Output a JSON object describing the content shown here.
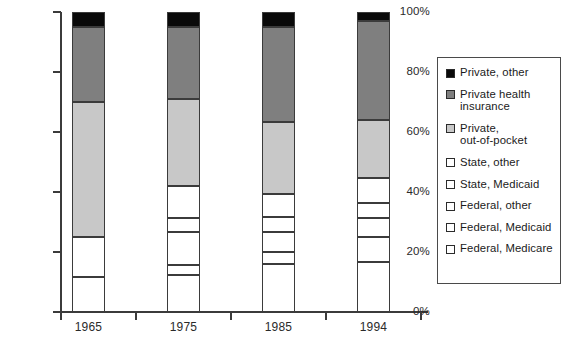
{
  "chart_data": {
    "type": "bar",
    "subtype": "stacked-percentage",
    "title": "",
    "xlabel": "",
    "ylabel": "",
    "categories": [
      "1965",
      "1975",
      "1985",
      "1994"
    ],
    "ylim": [
      0,
      100
    ],
    "ytick_labels": [
      "0%",
      "20%",
      "40%",
      "60%",
      "80%",
      "100%"
    ],
    "ytick_values": [
      0,
      20,
      40,
      60,
      80,
      100
    ],
    "grid": false,
    "legend_position": "right",
    "stack_order_bottom_to_top": [
      "Federal, Medicare",
      "Federal, Medicaid",
      "Federal, other",
      "State, Medicaid",
      "State, other",
      "Private, out-of-pocket",
      "Private health insurance",
      "Private, other"
    ],
    "series": [
      {
        "name": "Federal, Medicare",
        "color": "#ffffff",
        "values": [
          11.7,
          12.3,
          16.0,
          16.7
        ]
      },
      {
        "name": "Federal, Medicaid",
        "color": "#ffffff",
        "values": [
          0.0,
          3.4,
          4.0,
          8.3
        ]
      },
      {
        "name": "Federal, other",
        "color": "#ffffff",
        "values": [
          13.3,
          11.0,
          6.7,
          6.3
        ]
      },
      {
        "name": "State, Medicaid",
        "color": "#ffffff",
        "values": [
          0.0,
          4.6,
          5.0,
          5.0
        ]
      },
      {
        "name": "State, other",
        "color": "#ffffff",
        "values": [
          0.0,
          10.7,
          7.7,
          8.4
        ]
      },
      {
        "name": "Private, out-of-pocket",
        "color": "#c8c8c8",
        "values": [
          45.0,
          29.0,
          24.1,
          19.3
        ]
      },
      {
        "name": "Private health insurance",
        "color": "#7f7f7f",
        "values": [
          25.0,
          24.0,
          31.5,
          33.0
        ]
      },
      {
        "name": "Private, other",
        "color": "#0a0a0a",
        "values": [
          5.0,
          5.0,
          5.0,
          5.0
        ]
      }
    ],
    "cumulative_tops": {
      "1965": [
        11.7,
        11.7,
        25.0,
        25.0,
        25.0,
        70.0,
        95.0,
        100.0
      ],
      "1975": [
        12.3,
        15.7,
        26.7,
        31.3,
        42.0,
        71.0,
        95.0,
        100.0
      ],
      "1985": [
        16.0,
        20.0,
        26.7,
        31.7,
        39.4,
        63.5,
        95.0,
        100.0
      ],
      "1994": [
        16.7,
        25.0,
        31.3,
        36.3,
        44.7,
        64.0,
        97.0,
        100.0
      ]
    }
  },
  "axis": {
    "y_labels": [
      "100%",
      "80%",
      "60%",
      "40%",
      "20%",
      "0%"
    ],
    "x_labels": [
      "1965",
      "1975",
      "1985",
      "1994"
    ]
  },
  "legend": {
    "items": [
      {
        "label": "Private, other",
        "swatch": "black-swatch-icon",
        "color": "#0a0a0a"
      },
      {
        "label": "Private health\ninsurance",
        "swatch": "dark-gray-swatch-icon",
        "color": "#7f7f7f"
      },
      {
        "label": "Private,\nout-of-pocket",
        "swatch": "light-gray-swatch-icon",
        "color": "#c8c8c8"
      },
      {
        "label": "State, other",
        "swatch": "white-swatch-icon",
        "color": "#ffffff"
      },
      {
        "label": "State, Medicaid",
        "swatch": "white-swatch-icon",
        "color": "#ffffff"
      },
      {
        "label": "Federal, other",
        "swatch": "white-swatch-icon",
        "color": "#ffffff"
      },
      {
        "label": "Federal, Medicaid",
        "swatch": "white-swatch-icon",
        "color": "#ffffff"
      },
      {
        "label": "Federal, Medicare",
        "swatch": "white-swatch-icon",
        "color": "#ffffff"
      }
    ]
  },
  "colors": {
    "black": "#0a0a0a",
    "dark_gray": "#7f7f7f",
    "light_gray": "#c8c8c8",
    "white": "#ffffff",
    "outline": "#3b3b3b"
  }
}
